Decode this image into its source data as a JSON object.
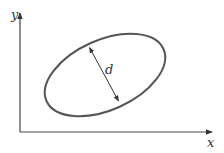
{
  "diagram": {
    "axes": {
      "x_label": "x",
      "y_label": "y"
    },
    "ellipse": {
      "label": "d",
      "description": "tilted ellipse with double-headed arrow across minor axis"
    },
    "colors": {
      "stroke": "#444444",
      "ellipse_stroke": "#555555",
      "background": "#ffffff"
    }
  }
}
